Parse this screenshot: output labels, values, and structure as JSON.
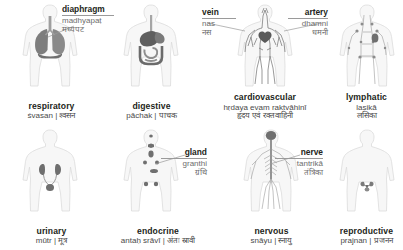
{
  "page": {
    "language_pair": "English | Hindi",
    "colors": {
      "body_outline": "#d9d9d9",
      "body_fill": "#f7f7f7",
      "organ_dark": "#6f6f6f",
      "organ_mid": "#9a9a9a",
      "organ_light": "#c4c4c4",
      "text": "#231f20",
      "leader_line": "#9a9a9a"
    }
  },
  "systems": [
    {
      "id": "respiratory",
      "en": "respiratory",
      "translit": "śvasan",
      "devanagari": "श्वसन",
      "separator": "|",
      "caption_lines": 2,
      "figure": "respiratory-figure"
    },
    {
      "id": "digestive",
      "en": "digestive",
      "translit": "pāchak",
      "devanagari": "पाचक",
      "separator": "|",
      "caption_lines": 2,
      "figure": "digestive-figure"
    },
    {
      "id": "cardiovascular",
      "en": "cardiovascular",
      "translit": "hṛdaya evam raktvāhinī",
      "devanagari": "हृदय एवं रक्तवाहिनी",
      "separator": "",
      "caption_lines": 3,
      "figure": "cardiovascular-figure"
    },
    {
      "id": "lymphatic",
      "en": "lymphatic",
      "translit": "lasikā",
      "devanagari": "लसिका",
      "separator": "",
      "caption_lines": 3,
      "figure": "lymphatic-figure"
    },
    {
      "id": "urinary",
      "en": "urinary",
      "translit": "mūtr",
      "devanagari": "मूत्र",
      "separator": "|",
      "caption_lines": 2,
      "figure": "urinary-figure"
    },
    {
      "id": "endocrine",
      "en": "endocrine",
      "translit": "antaḥ srāvī",
      "devanagari": "अंतः स्रावी",
      "separator": "|",
      "caption_lines": 2,
      "figure": "endocrine-figure"
    },
    {
      "id": "nervous",
      "en": "nervous",
      "translit": "snāyu",
      "devanagari": "स्नायु",
      "separator": "|",
      "caption_lines": 2,
      "figure": "nervous-figure"
    },
    {
      "id": "reproductive",
      "en": "reproductive",
      "translit": "prajnan",
      "devanagari": "प्रजनन",
      "separator": "|",
      "caption_lines": 2,
      "figure": "reproductive-figure"
    }
  ],
  "callouts": [
    {
      "id": "diaphragm",
      "en": "diaphragm",
      "translit": "madhyapaṭ",
      "devanagari": "मध्यपट",
      "belongs_to": "respiratory",
      "align": "left"
    },
    {
      "id": "vein",
      "en": "vein",
      "translit": "nas",
      "devanagari": "नस",
      "belongs_to": "cardiovascular",
      "align": "left"
    },
    {
      "id": "artery",
      "en": "artery",
      "translit": "dhamni",
      "devanagari": "धमनी",
      "belongs_to": "cardiovascular",
      "align": "right"
    },
    {
      "id": "gland",
      "en": "gland",
      "translit": "granthi",
      "devanagari": "ग्रंथि",
      "belongs_to": "endocrine",
      "align": "right"
    },
    {
      "id": "nerve",
      "en": "nerve",
      "translit": "tantrikā",
      "devanagari": "तंत्रिका",
      "belongs_to": "nervous",
      "align": "right"
    }
  ]
}
